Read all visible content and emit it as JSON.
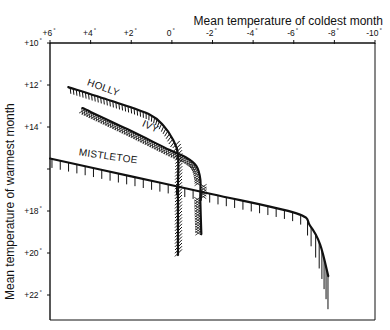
{
  "chart_data": {
    "type": "line",
    "title": "",
    "xlabel": "Mean temperature of coldest month",
    "ylabel": "Mean temperature of warmest month",
    "x_axis_position": "top",
    "x_reversed": true,
    "y_reversed": true,
    "xlim": [
      6,
      -10
    ],
    "ylim": [
      10,
      23.2
    ],
    "x_ticks": [
      {
        "value": 6,
        "label": "+6°"
      },
      {
        "value": 4,
        "label": "+4°"
      },
      {
        "value": 2,
        "label": "+2°"
      },
      {
        "value": 0,
        "label": "0°"
      },
      {
        "value": -2,
        "label": "-2°"
      },
      {
        "value": -4,
        "label": "-4°"
      },
      {
        "value": -6,
        "label": "-6°"
      },
      {
        "value": -8,
        "label": "-8°"
      },
      {
        "value": -10,
        "label": "-10°"
      }
    ],
    "y_ticks": [
      {
        "value": 10,
        "label": "+10°"
      },
      {
        "value": 12,
        "label": "+12°"
      },
      {
        "value": 14,
        "label": "+14°"
      },
      {
        "value": 16,
        "label": ""
      },
      {
        "value": 18,
        "label": "+18°"
      },
      {
        "value": 20,
        "label": "+20°"
      },
      {
        "value": 22,
        "label": "+22°"
      }
    ],
    "grid": false,
    "legend": "none (curves labelled directly)",
    "series": [
      {
        "name": "HOLLY",
        "hatch": "ticks",
        "points": [
          [
            5.1,
            12.1
          ],
          [
            3.0,
            12.75
          ],
          [
            1.1,
            13.4
          ],
          [
            0.4,
            13.95
          ],
          [
            -0.05,
            14.6
          ],
          [
            -0.3,
            15.3
          ],
          [
            -0.3,
            17.0
          ],
          [
            -0.3,
            20.1
          ]
        ]
      },
      {
        "name": "IVY",
        "hatch": "crosshatch",
        "points": [
          [
            4.4,
            13.1
          ],
          [
            2.2,
            14.1
          ],
          [
            0.1,
            15.1
          ],
          [
            -0.7,
            15.45
          ],
          [
            -1.2,
            15.85
          ],
          [
            -1.4,
            16.5
          ],
          [
            -1.4,
            17.5
          ],
          [
            -1.45,
            19.1
          ]
        ]
      },
      {
        "name": "MISTLETOE",
        "hatch": "ticks",
        "points": [
          [
            6.0,
            15.5
          ],
          [
            2.0,
            16.35
          ],
          [
            -2.0,
            17.2
          ],
          [
            -6.1,
            18.1
          ],
          [
            -6.8,
            18.7
          ],
          [
            -7.3,
            19.6
          ],
          [
            -7.7,
            21.1
          ]
        ]
      }
    ]
  }
}
